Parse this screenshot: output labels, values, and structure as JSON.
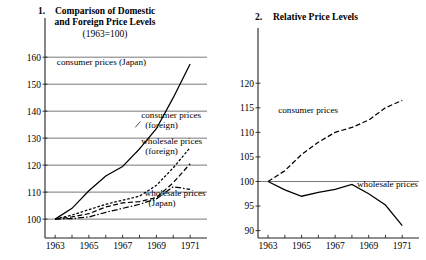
{
  "figure": {
    "background": "#ffffff",
    "ink": "#000000"
  },
  "chart_data": [
    {
      "type": "line",
      "panel_number": "1.",
      "title": "Comparison of Domestic",
      "title_line2": "and Foreign Price Levels",
      "subtitle": "(1963=100)",
      "xlabel": "",
      "ylabel": "",
      "x": [
        1963,
        1964,
        1965,
        1966,
        1967,
        1968,
        1969,
        1970,
        1971
      ],
      "xlim": [
        1962.4,
        1972.0
      ],
      "ylim": [
        93,
        166
      ],
      "yticks": [
        100,
        110,
        120,
        130,
        140,
        150,
        160
      ],
      "xticks": [
        1963,
        1964,
        1965,
        1966,
        1967,
        1968,
        1969,
        1970,
        1971
      ],
      "xticklabels": [
        "1963",
        "",
        "1965",
        "",
        "1967",
        "",
        "1969",
        "",
        "1971"
      ],
      "grid": true,
      "legend": "inline-annotations",
      "series": [
        {
          "name": "consumer prices (Japan)",
          "style": "solid",
          "label": "consumer prices (Japan)",
          "label_x": 1963.1,
          "label_y": 157.0,
          "values": [
            100.0,
            104.0,
            110.5,
            116.0,
            119.5,
            126.0,
            133.5,
            145.0,
            157.5
          ]
        },
        {
          "name": "consumer prices (foreign)",
          "style": "dotted-dash",
          "label": "consumer prices",
          "label2": "(foreign)",
          "label_x": 1968.1,
          "label_y": 137.5,
          "values": [
            100.0,
            101.5,
            103.5,
            105.5,
            107.0,
            108.5,
            112.5,
            119.0,
            126.5
          ]
        },
        {
          "name": "wholesale prices (foreign)",
          "style": "dashed",
          "label": "wholesale prices",
          "label2": "(foreign)",
          "label_x": 1968.1,
          "label_y": 128.0,
          "values": [
            100.0,
            100.8,
            102.0,
            104.5,
            106.0,
            106.5,
            108.0,
            113.5,
            120.5
          ]
        },
        {
          "name": "wholesale prices (Japan)",
          "style": "dash-dot",
          "label": "wholesale prices",
          "label2": "(Japan)",
          "label_x": 1968.3,
          "label_y": 108.5,
          "values": [
            100.0,
            100.2,
            100.8,
            102.5,
            104.0,
            105.5,
            107.5,
            112.0,
            111.0
          ]
        }
      ]
    },
    {
      "type": "line",
      "panel_number": "2.",
      "title": "Relative Price Levels",
      "xlabel": "",
      "ylabel": "",
      "x": [
        1963,
        1964,
        1965,
        1966,
        1967,
        1968,
        1969,
        1970,
        1971
      ],
      "xlim": [
        1962.4,
        1972.0
      ],
      "ylim": [
        88.5,
        123.5
      ],
      "yticks": [
        90,
        95,
        100,
        105,
        110,
        115,
        120
      ],
      "xticks": [
        1963,
        1964,
        1965,
        1966,
        1967,
        1968,
        1969,
        1970,
        1971
      ],
      "xticklabels": [
        "1963",
        "",
        "1965",
        "",
        "1967",
        "",
        "1969",
        "",
        "1971"
      ],
      "grid": false,
      "baseline": 100,
      "legend": "inline-annotations",
      "series": [
        {
          "name": "consumer prices",
          "style": "dashed",
          "label": "consumer prices",
          "label_x": 1963.6,
          "label_y": 114.0,
          "values": [
            100.0,
            102.2,
            105.5,
            108.0,
            110.0,
            111.0,
            112.5,
            115.0,
            116.5
          ]
        },
        {
          "name": "wholesale prices",
          "style": "solid",
          "label": "wholesale prices",
          "label_x": 1968.3,
          "label_y": 98.8,
          "values": [
            100.0,
            98.3,
            97.0,
            97.8,
            98.4,
            99.4,
            97.5,
            95.2,
            91.0
          ]
        }
      ]
    }
  ]
}
